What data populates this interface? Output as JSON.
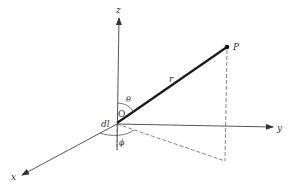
{
  "diagram": {
    "labels": {
      "z_axis": "z",
      "y_axis": "y",
      "x_axis": "x",
      "point": "P",
      "radius": "r",
      "theta": "θ",
      "phi": "ϕ",
      "origin": "O",
      "element": "dl"
    },
    "colors": {
      "axis": "#555555",
      "radius": "#1a1a1a",
      "dashed": "#666666",
      "background": "#ffffff"
    }
  }
}
